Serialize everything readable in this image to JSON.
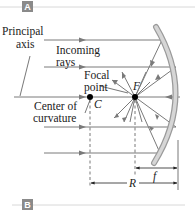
{
  "panels": {
    "top_label": "A",
    "bottom_label": "B"
  },
  "labels": {
    "principal_axis_line1": "Principal",
    "principal_axis_line2": "axis",
    "incoming_rays_line1": "Incoming",
    "incoming_rays_line2": "rays",
    "focal_point_line1": "Focal",
    "focal_point_line2": "point",
    "center_line1": "Center of",
    "center_line2": "curvature",
    "C": "C",
    "F": "F",
    "f": "f",
    "R": "R"
  },
  "colors": {
    "panel_badge": "#8a8a8a",
    "panel_rule": "#d8d8d8",
    "ray": "#7a7a7a",
    "mirror_face": "#c9c9c9",
    "mirror_edge": "#9a9a9a",
    "point": "#000000",
    "text": "#222222"
  }
}
